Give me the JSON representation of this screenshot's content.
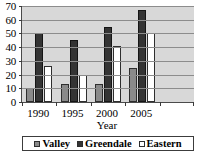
{
  "chart_data": {
    "type": "bar",
    "title": "",
    "xlabel": "Year",
    "ylabel": "",
    "categories": [
      "1990",
      "1995",
      "2000",
      "2005"
    ],
    "series": [
      {
        "name": "Valley",
        "color": "#8a8a8a",
        "values": [
          10,
          13,
          13,
          25
        ]
      },
      {
        "name": "Greendale",
        "color": "#343434",
        "values": [
          50,
          45,
          55,
          67
        ]
      },
      {
        "name": "Eastern",
        "color": "#ffffff",
        "values": [
          26,
          20,
          41,
          50
        ]
      }
    ],
    "ylim": [
      0,
      70
    ],
    "yticks": [
      0,
      10,
      20,
      30,
      40,
      50,
      60,
      70
    ],
    "ytick_labels": [
      "0",
      "10",
      "20",
      "30",
      "40",
      "50",
      "60",
      "70"
    ],
    "grid": true,
    "legend_position": "bottom",
    "plot_background": "#d8d8d8",
    "axis_color": "#4a4a4a",
    "gridline_color": "#8c8c8c"
  },
  "legend": {
    "items": [
      {
        "label": "Valley"
      },
      {
        "label": "Greendale"
      },
      {
        "label": "Eastern"
      }
    ]
  }
}
